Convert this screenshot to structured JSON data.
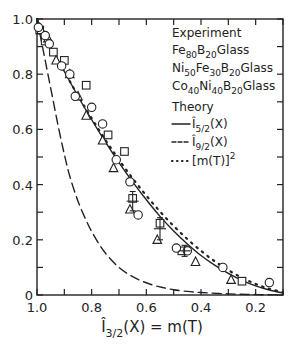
{
  "chart_data": {
    "type": "line",
    "title": "",
    "xlabel": "Î3/2(X) = m(T)",
    "ylabel": "",
    "xlim": [
      1.0,
      0.1
    ],
    "ylim": [
      0,
      1.0
    ],
    "x_reversed": true,
    "grid": false,
    "x_ticks": [
      1.0,
      0.9,
      0.8,
      0.7,
      0.6,
      0.5,
      0.4,
      0.3,
      0.2,
      0.1
    ],
    "x_tick_labels": [
      "1.0",
      "0.8",
      "0.6",
      "0.4",
      "0.2"
    ],
    "y_ticks": [
      0,
      0.1,
      0.2,
      0.3,
      0.4,
      0.5,
      0.6,
      0.7,
      0.8,
      0.9,
      1.0
    ],
    "y_tick_labels": [
      "0",
      "0.2",
      "0.4",
      "0.6",
      "0.8",
      "1.0"
    ],
    "legend": {
      "position": "upper right",
      "experiment_title": "Experiment",
      "theory_title": "Theory",
      "entries": [
        {
          "group": "experiment",
          "marker": "square",
          "text": "Fe80B20Glass",
          "parts": [
            [
              "Fe",
              ""
            ],
            [
              "80",
              "sub"
            ],
            [
              "B",
              ""
            ],
            [
              "20",
              "sub"
            ],
            [
              "Glass",
              ""
            ]
          ]
        },
        {
          "group": "experiment",
          "marker": "triangle",
          "text": "Ni50Fe30B20Glass",
          "parts": [
            [
              "Ni",
              ""
            ],
            [
              "50",
              "sub"
            ],
            [
              "Fe",
              ""
            ],
            [
              "30",
              "sub"
            ],
            [
              "B",
              ""
            ],
            [
              "20",
              "sub"
            ],
            [
              "Glass",
              ""
            ]
          ]
        },
        {
          "group": "experiment",
          "marker": "circle",
          "text": "Co40Ni40B20Glass",
          "parts": [
            [
              "Co",
              ""
            ],
            [
              "40",
              "sub"
            ],
            [
              "Ni",
              ""
            ],
            [
              "40",
              "sub"
            ],
            [
              "B",
              ""
            ],
            [
              "20",
              "sub"
            ],
            [
              "Glass",
              ""
            ]
          ]
        },
        {
          "group": "theory",
          "style": "solid",
          "text": "Î5/2(X)"
        },
        {
          "group": "theory",
          "style": "dashed",
          "text": "Î9/2(X)"
        },
        {
          "group": "theory",
          "style": "dotted",
          "text": "[m(T)]²"
        }
      ]
    },
    "series": [
      {
        "name": "Î5/2(X)",
        "style": "solid",
        "x": [
          1.0,
          0.95,
          0.9,
          0.85,
          0.8,
          0.75,
          0.7,
          0.65,
          0.6,
          0.55,
          0.5,
          0.45,
          0.4,
          0.35,
          0.3,
          0.25,
          0.2,
          0.15,
          0.1
        ],
        "y": [
          1.0,
          0.9,
          0.81,
          0.72,
          0.635,
          0.555,
          0.48,
          0.41,
          0.345,
          0.285,
          0.232,
          0.185,
          0.143,
          0.108,
          0.078,
          0.053,
          0.033,
          0.018,
          0.007
        ]
      },
      {
        "name": "Î9/2(X)",
        "style": "dashed",
        "x": [
          1.0,
          0.98,
          0.96,
          0.94,
          0.92,
          0.9,
          0.88,
          0.85,
          0.82,
          0.8,
          0.77,
          0.74,
          0.7,
          0.66,
          0.62,
          0.58,
          0.54,
          0.5,
          0.45,
          0.4,
          0.3,
          0.2,
          0.1
        ],
        "y": [
          1.0,
          0.9,
          0.8,
          0.7,
          0.6,
          0.51,
          0.43,
          0.34,
          0.27,
          0.23,
          0.18,
          0.14,
          0.1,
          0.072,
          0.052,
          0.037,
          0.027,
          0.019,
          0.013,
          0.009,
          0.004,
          0.0015,
          0.0003
        ]
      },
      {
        "name": "[m(T)]²",
        "style": "dotted",
        "x": [
          1.0,
          0.95,
          0.9,
          0.85,
          0.8,
          0.75,
          0.7,
          0.65,
          0.6,
          0.55,
          0.5,
          0.45,
          0.4,
          0.35,
          0.3,
          0.25,
          0.2,
          0.15,
          0.1
        ],
        "y": [
          1.0,
          0.9025,
          0.81,
          0.7225,
          0.64,
          0.5625,
          0.49,
          0.4225,
          0.36,
          0.3025,
          0.25,
          0.2025,
          0.16,
          0.1225,
          0.09,
          0.0625,
          0.04,
          0.0225,
          0.01
        ]
      },
      {
        "name": "Fe80B20 Glass",
        "marker": "square",
        "x": [
          0.99,
          0.97,
          0.94,
          0.9,
          0.82,
          0.74,
          0.68,
          0.65,
          0.55,
          0.47,
          0.25
        ],
        "y": [
          0.96,
          0.92,
          0.88,
          0.85,
          0.76,
          0.58,
          0.52,
          0.35,
          0.26,
          0.16,
          0.05
        ]
      },
      {
        "name": "Ni50Fe30B20 Glass",
        "marker": "triangle",
        "x": [
          0.985,
          0.96,
          0.93,
          0.88,
          0.85,
          0.82,
          0.76,
          0.72,
          0.66,
          0.56,
          0.42,
          0.29
        ],
        "y": [
          0.96,
          0.93,
          0.85,
          0.8,
          0.72,
          0.65,
          0.56,
          0.46,
          0.31,
          0.2,
          0.12,
          0.055
        ]
      },
      {
        "name": "Co40Ni40B20 Glass",
        "marker": "circle",
        "x": [
          0.995,
          0.97,
          0.955,
          0.91,
          0.88,
          0.86,
          0.8,
          0.76,
          0.71,
          0.66,
          0.63,
          0.49,
          0.45,
          0.32,
          0.15
        ],
        "y": [
          0.97,
          0.94,
          0.91,
          0.83,
          0.8,
          0.72,
          0.68,
          0.62,
          0.49,
          0.41,
          0.29,
          0.17,
          0.16,
          0.1,
          0.045
        ]
      }
    ],
    "error_bars": [
      {
        "x": 0.65,
        "y": 0.34,
        "err": 0.035
      },
      {
        "x": 0.55,
        "y": 0.24,
        "err": 0.04
      },
      {
        "x": 0.46,
        "y": 0.16,
        "err": 0.02
      }
    ]
  }
}
